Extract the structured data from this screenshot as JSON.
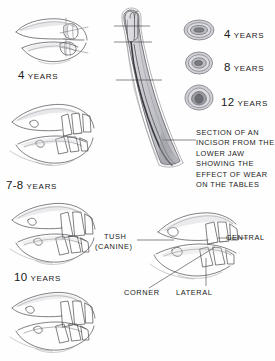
{
  "figure": {
    "background_color": "#fefefe",
    "ink_color": "#4a4a4f"
  },
  "jaw_series": {
    "description": "Side views of horse incisor jaws at successive ages",
    "items": [
      {
        "id": "jaw-4-years",
        "age_number": "4",
        "age_word": "YEARS",
        "label_x": 18,
        "label_y": 66,
        "art_x": 10,
        "art_y": 8,
        "art_w": 88,
        "art_h": 58
      },
      {
        "id": "jaw-7-8-years",
        "age_number": "7-8",
        "age_word": "YEARS",
        "label_x": 6,
        "label_y": 176,
        "art_x": 8,
        "art_y": 96,
        "art_w": 94,
        "art_h": 74
      },
      {
        "id": "jaw-10-years",
        "age_number": "10",
        "age_word": "YEARS",
        "label_x": 14,
        "label_y": 268,
        "art_x": 8,
        "art_y": 196,
        "art_w": 94,
        "art_h": 70
      },
      {
        "id": "jaw-labelled",
        "age_number": "",
        "age_word": "",
        "art_x": 8,
        "art_y": 286,
        "art_w": 96,
        "art_h": 72
      }
    ]
  },
  "incisor_section": {
    "name": "longitudinal-incisor-section",
    "caption_lines": [
      "SECTION OF AN",
      "INCISOR FROM THE",
      "LOWER JAW",
      "SHOWING THE",
      "EFFECT OF WEAR",
      "ON THE TABLES"
    ],
    "section_line_count": 3
  },
  "cross_sections": {
    "name": "incisor-table-cross-sections",
    "items": [
      {
        "id": "section-4-years",
        "shape": "oval-wide",
        "age_number": "4",
        "age_word": "YEARS"
      },
      {
        "id": "section-8-years",
        "shape": "oval-rounded",
        "age_number": "8",
        "age_word": "YEARS"
      },
      {
        "id": "section-12-years",
        "shape": "triangular",
        "age_number": "12",
        "age_word": "YEARS"
      }
    ]
  },
  "pointer_labels": {
    "tush_line1": "TUSH",
    "tush_line2": "(CANINE)",
    "central": "CENTRAL",
    "lateral": "LATERAL",
    "corner": "CORNER"
  }
}
